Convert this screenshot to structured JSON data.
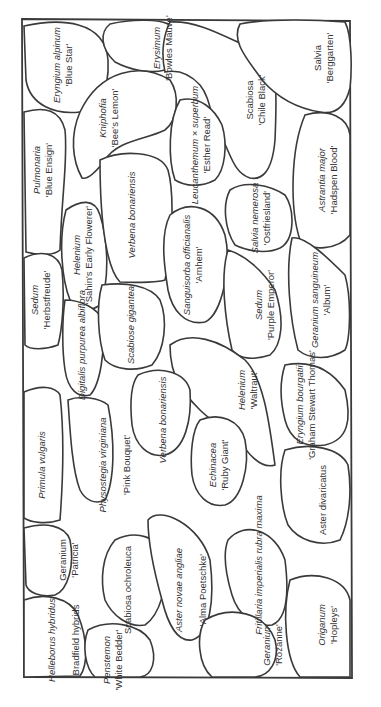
{
  "diagram": {
    "type": "planting-plan",
    "orientation": "rotated-90",
    "colors": {
      "line": "#3a3a3a",
      "text": "#333333",
      "background": "#ffffff"
    },
    "plants": [
      {
        "id": "eryngium-alpinum",
        "genus": "Eryngium alpinum",
        "cultivar": "'Blue Star'"
      },
      {
        "id": "erysimum",
        "genus": "Erysimum",
        "cultivar": "'Bowles Mauve'"
      },
      {
        "id": "salvia-berggarten",
        "genus": "Salvia",
        "cultivar": "'Berggarten'"
      },
      {
        "id": "kniphofia",
        "genus": "Kniphofia",
        "cultivar": "'Bee's Lemon'"
      },
      {
        "id": "scabiosa-chile-black",
        "genus": "Scabiosa",
        "cultivar": "'Chile Black'"
      },
      {
        "id": "pulmonaria",
        "genus": "Pulmonaria",
        "cultivar": "'Blue Ensign'"
      },
      {
        "id": "leucanthemum",
        "genus": "Leucanthemum × superbum",
        "cultivar": "'Esther Read'"
      },
      {
        "id": "astrantia",
        "genus": "Astrantia major",
        "cultivar": "'Hadspen Blood'"
      },
      {
        "id": "helenium-sahin",
        "genus": "Helenium",
        "cultivar": "'Sahin's Early Flowerer'"
      },
      {
        "id": "verbena-1",
        "genus": "Verbena bonariensis",
        "cultivar": ""
      },
      {
        "id": "salvia-nemorosa",
        "genus": "Salvia nemerosa",
        "cultivar": "'Ostfriesland'"
      },
      {
        "id": "sedum-herbstfreude",
        "genus": "Sedum",
        "cultivar": "'Herbstfreude'"
      },
      {
        "id": "sanguisorba",
        "genus": "Sanguisorba officianalis",
        "cultivar": "'Arnhem'"
      },
      {
        "id": "sedum-purple",
        "genus": "Sedum",
        "cultivar": "'Purple Emperor'"
      },
      {
        "id": "geranium-sanguineum",
        "genus": "Geranium sanguineum",
        "cultivar": "'Album'"
      },
      {
        "id": "digitalis",
        "genus": "Digitalis purpurea albiflora",
        "cultivar": ""
      },
      {
        "id": "scabiosa-gigantea",
        "genus": "Scabiose gigantea",
        "cultivar": ""
      },
      {
        "id": "helenium-waltraut",
        "genus": "Helenium",
        "cultivar": "'Waltraut'"
      },
      {
        "id": "eryngium-bourgatii",
        "genus": "Eryngium bourgatii",
        "cultivar": "'Graham Stewart Thomas'"
      },
      {
        "id": "primula",
        "genus": "Primula vulgaris",
        "cultivar": ""
      },
      {
        "id": "physostegia",
        "genus": "Physostegia virginiana",
        "cultivar": "'Pink Bouquet'"
      },
      {
        "id": "verbena-2",
        "genus": "Verbena bonariensis",
        "cultivar": ""
      },
      {
        "id": "echinacea",
        "genus": "Echinacea",
        "cultivar": "'Ruby Giant'"
      },
      {
        "id": "aster-divaricatus",
        "genus": "Aster divaricatus",
        "cultivar": ""
      },
      {
        "id": "geranium-patricia",
        "genus": "Geranium",
        "cultivar": "'Patricia'"
      },
      {
        "id": "scabiosa-ochroleuca",
        "genus": "Scabiosa ochroleuca",
        "cultivar": ""
      },
      {
        "id": "aster-novae",
        "genus": "Aster novae angliae",
        "cultivar": "'Alma Poetschke'"
      },
      {
        "id": "fritillaria",
        "genus": "Fritillaria imperialis rubra maxima",
        "cultivar": ""
      },
      {
        "id": "helleborus",
        "genus": "Helleborus hybridus",
        "cultivar": "Bradfield hybrids"
      },
      {
        "id": "penstemon",
        "genus": "Penstemon",
        "cultivar": "'White Bedder'"
      },
      {
        "id": "geranium-rozanne",
        "genus": "Geranium",
        "cultivar": "'Rozanne'"
      },
      {
        "id": "origanum",
        "genus": "Origanum",
        "cultivar": "'Hopleys'"
      }
    ]
  }
}
